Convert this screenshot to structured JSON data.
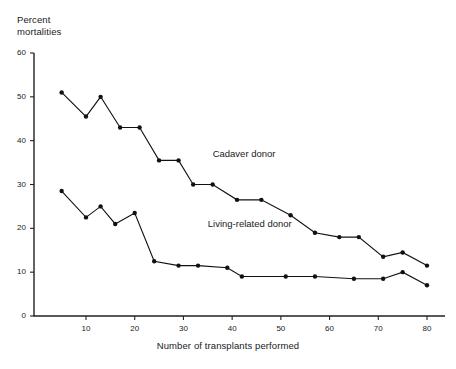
{
  "chart_data": {
    "type": "line",
    "title": "",
    "xlabel": "Number of transplants performed",
    "ylabel": "Percent\nmortalities",
    "xlim": [
      0,
      84
    ],
    "ylim": [
      0,
      60
    ],
    "xticks": [
      10,
      20,
      30,
      40,
      50,
      60,
      70,
      80
    ],
    "yticks": [
      0,
      10,
      20,
      30,
      40,
      50,
      60
    ],
    "grid": false,
    "legend_position": "inline-annotation",
    "series": [
      {
        "name": "Cadaver donor",
        "label_x": 36,
        "label_y": 37,
        "points": [
          [
            5,
            51
          ],
          [
            10,
            45.5
          ],
          [
            13,
            50
          ],
          [
            17,
            43
          ],
          [
            21,
            43
          ],
          [
            25,
            35.5
          ],
          [
            29,
            35.5
          ],
          [
            32,
            30
          ],
          [
            36,
            30
          ],
          [
            41,
            26.5
          ],
          [
            46,
            26.5
          ],
          [
            52,
            23
          ],
          [
            57,
            19
          ],
          [
            62,
            18
          ],
          [
            66,
            18
          ],
          [
            71,
            13.5
          ],
          [
            75,
            14.5
          ],
          [
            80,
            11.5
          ]
        ]
      },
      {
        "name": "Living-related donor",
        "label_x": 35,
        "label_y": 21,
        "points": [
          [
            5,
            28.5
          ],
          [
            10,
            22.5
          ],
          [
            13,
            25
          ],
          [
            16,
            21
          ],
          [
            20,
            23.5
          ],
          [
            24,
            12.5
          ],
          [
            29,
            11.5
          ],
          [
            33,
            11.5
          ],
          [
            39,
            11
          ],
          [
            42,
            9
          ],
          [
            51,
            9
          ],
          [
            57,
            9
          ],
          [
            65,
            8.5
          ],
          [
            71,
            8.5
          ],
          [
            75,
            10
          ],
          [
            80,
            7
          ]
        ]
      }
    ]
  },
  "labels": {
    "xtick_text": [
      "10",
      "20",
      "30",
      "40",
      "50",
      "60",
      "70",
      "80"
    ],
    "ytick_text": [
      "0",
      "10",
      "20",
      "30",
      "40",
      "50",
      "60"
    ],
    "y_axis_title": "Percent\nmortalities",
    "x_axis_title": "Number of transplants performed",
    "series_1": "Cadaver donor",
    "series_2": "Living-related donor"
  },
  "colors": {
    "line": "#111111",
    "axis": "#222222",
    "background": "#ffffff",
    "text": "#1a1a1a"
  }
}
